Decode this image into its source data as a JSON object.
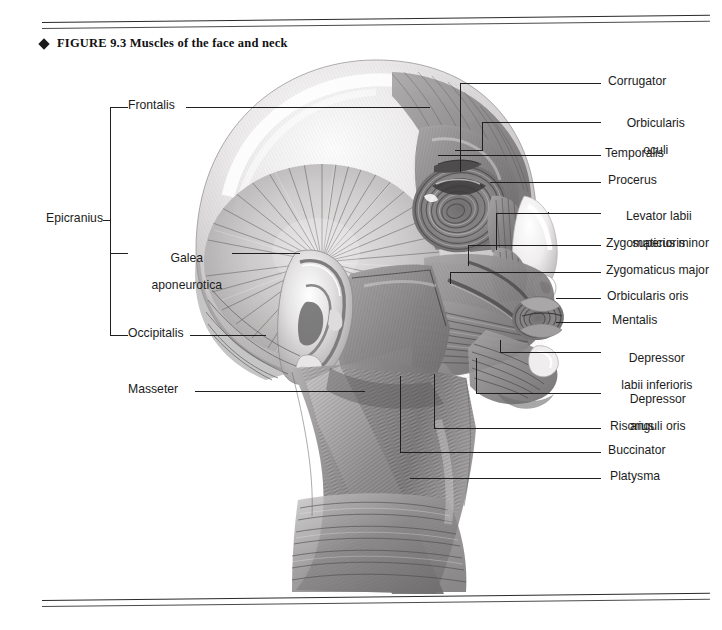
{
  "figure": {
    "bullet": "◆",
    "number": "FIGURE 9.3",
    "title": "Muscles of the face and neck",
    "caption_full": "FIGURE 9.3  Muscles of the face and neck"
  },
  "labels_left": [
    {
      "key": "frontalis",
      "text": "Frontalis"
    },
    {
      "key": "epicranius",
      "text": "Epicranius"
    },
    {
      "key": "galea",
      "line1": "Galea",
      "line2": "aponeurotica",
      "text": "Galea aponeurotica"
    },
    {
      "key": "occipitalis",
      "text": "Occipitalis"
    },
    {
      "key": "masseter",
      "text": "Masseter"
    }
  ],
  "labels_right": [
    {
      "key": "corrugator",
      "text": "Corrugator"
    },
    {
      "key": "orbicularis-oculi",
      "line1": "Orbicularis",
      "line2": "oculi",
      "text": "Orbicularis oculi"
    },
    {
      "key": "temporalis",
      "text": "Temporalis"
    },
    {
      "key": "procerus",
      "text": "Procerus"
    },
    {
      "key": "levator-labii",
      "line1": "Levator labii",
      "line2": "superioris",
      "text": "Levator labii superioris"
    },
    {
      "key": "zygomaticus-minor",
      "text": "Zygomaticus minor"
    },
    {
      "key": "zygomaticus-major",
      "text": "Zygomaticus major"
    },
    {
      "key": "orbicularis-oris",
      "text": "Orbicularis oris"
    },
    {
      "key": "mentalis",
      "text": "Mentalis"
    },
    {
      "key": "depressor-labii",
      "line1": "Depressor",
      "line2": "labii inferioris",
      "text": "Depressor labii inferioris"
    },
    {
      "key": "depressor-anguli",
      "line1": "Depressor",
      "line2": "anguli oris",
      "text": "Depressor anguli oris"
    },
    {
      "key": "risorius",
      "text": "Risorius"
    },
    {
      "key": "buccinator",
      "text": "Buccinator"
    },
    {
      "key": "platysma",
      "text": "Platysma"
    }
  ],
  "colors": {
    "rule": "#2a2a2a",
    "leader": "#1f1f1f",
    "text": "#1c1c1c",
    "art_dark": "#5b5b5b",
    "art_mid": "#9a9a9a",
    "art_light": "#d8d8d8",
    "page": "#ffffff"
  }
}
